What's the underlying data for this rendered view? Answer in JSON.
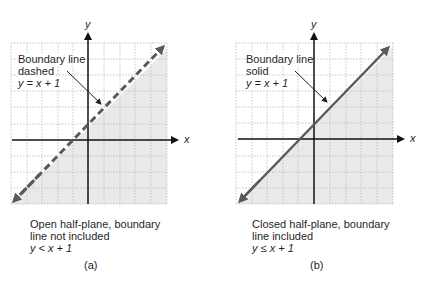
{
  "panels": [
    {
      "id": "a",
      "label": "(a)",
      "annotation": {
        "line1": "Boundary line",
        "line2": "dashed",
        "equation": "y = x + 1"
      },
      "caption": {
        "line1": "Open half-plane, boundary",
        "line2": "line not included",
        "inequality": "y < x + 1"
      },
      "axes": {
        "x_label": "x",
        "y_label": "y"
      },
      "boundary_style": "dashed",
      "shaded_region": "below line"
    },
    {
      "id": "b",
      "label": "(b)",
      "annotation": {
        "line1": "Boundary line",
        "line2": "solid",
        "equation": "y = x + 1"
      },
      "caption": {
        "line1": "Closed half-plane, boundary",
        "line2": "line included",
        "inequality": "y ≤ x + 1"
      },
      "axes": {
        "x_label": "x",
        "y_label": "y"
      },
      "boundary_style": "solid",
      "shaded_region": "below line"
    }
  ],
  "colors": {
    "shade": "#e9e9e9",
    "grid": "#b9b9b9",
    "axis": "#111111",
    "boundary": "#5a5a5a"
  }
}
